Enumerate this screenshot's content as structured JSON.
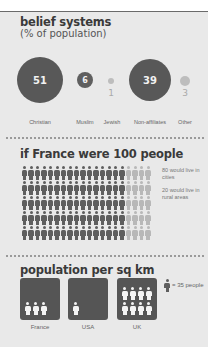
{
  "sections": {
    "beliefs": {
      "title": "belief systems",
      "subtitle": "(% of population)"
    },
    "france100": {
      "title": "if France were 100 people",
      "note_cities": "80 would live in cities",
      "note_rural": "20 would live in rural areas"
    },
    "density": {
      "title": "population per sq km",
      "legend": "= 35 people"
    }
  },
  "colors": {
    "panel_bg": "#e9e9e9",
    "dark": "#585858",
    "light": "#bdbdbd",
    "top_rule": "#6a6a6a"
  },
  "chart_data": [
    {
      "type": "bubble",
      "title": "belief systems",
      "subtitle": "(% of population)",
      "categories": [
        "Christian",
        "Muslim",
        "Jewish",
        "Non-affiliates",
        "Other"
      ],
      "values": [
        51,
        6,
        1,
        39,
        3
      ],
      "value_labels": [
        "51",
        "6",
        "1",
        "39",
        "3"
      ]
    },
    {
      "type": "pictograph",
      "title": "if France were 100 people",
      "total": 100,
      "grid": {
        "rows": 5,
        "cols": 20
      },
      "series": [
        {
          "name": "80 would live in cities",
          "value": 80
        },
        {
          "name": "20 would live in rural areas",
          "value": 20
        }
      ]
    },
    {
      "type": "pictograph",
      "title": "population per sq km",
      "unit": "1 icon = 35 people",
      "categories": [
        "France",
        "USA",
        "UK"
      ],
      "icons": [
        3,
        1,
        8
      ],
      "values": [
        105,
        35,
        280
      ]
    }
  ]
}
